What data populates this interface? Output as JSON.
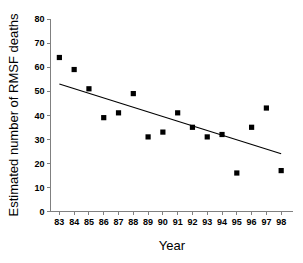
{
  "chart_data": {
    "type": "scatter",
    "title": "",
    "xlabel": "Year",
    "ylabel": "Estimated number of RMSF deaths",
    "x": [
      83,
      84,
      85,
      86,
      87,
      88,
      89,
      90,
      91,
      92,
      93,
      94,
      95,
      96,
      97,
      98
    ],
    "values": [
      64,
      59,
      51,
      39,
      41,
      49,
      31,
      33,
      41,
      35,
      31,
      32,
      16,
      35,
      43,
      17
    ],
    "xtick_labels": [
      "83",
      "84",
      "85",
      "86",
      "87",
      "88",
      "89",
      "90",
      "91",
      "92",
      "93",
      "94",
      "95",
      "96",
      "97",
      "98"
    ],
    "ytick_labels": [
      "0",
      "10",
      "20",
      "30",
      "40",
      "50",
      "60",
      "70",
      "80"
    ],
    "yticks": [
      0,
      10,
      20,
      30,
      40,
      50,
      60,
      70,
      80
    ],
    "xlim": [
      82.4,
      98.8
    ],
    "ylim": [
      0,
      80
    ],
    "grid": false,
    "legend": null,
    "series": [
      {
        "name": "Estimated number of RMSF deaths",
        "marker": "square",
        "color": "#000000",
        "points": [
          {
            "x": 83,
            "y": 64
          },
          {
            "x": 84,
            "y": 59
          },
          {
            "x": 85,
            "y": 51
          },
          {
            "x": 86,
            "y": 39
          },
          {
            "x": 87,
            "y": 41
          },
          {
            "x": 88,
            "y": 49
          },
          {
            "x": 89,
            "y": 31
          },
          {
            "x": 90,
            "y": 33
          },
          {
            "x": 91,
            "y": 41
          },
          {
            "x": 92,
            "y": 35
          },
          {
            "x": 93,
            "y": 31
          },
          {
            "x": 94,
            "y": 32
          },
          {
            "x": 95,
            "y": 16
          },
          {
            "x": 96,
            "y": 35
          },
          {
            "x": 97,
            "y": 43
          },
          {
            "x": 98,
            "y": 17
          }
        ]
      }
    ],
    "trend_line": {
      "name": "linear-fit",
      "color": "#000000",
      "x_start": 83,
      "y_start": 53,
      "x_end": 98,
      "y_end": 24
    },
    "colors": {
      "marker": "#000000",
      "trend": "#000000",
      "axis": "#808080",
      "text": "#000000",
      "background": "#ffffff"
    }
  }
}
